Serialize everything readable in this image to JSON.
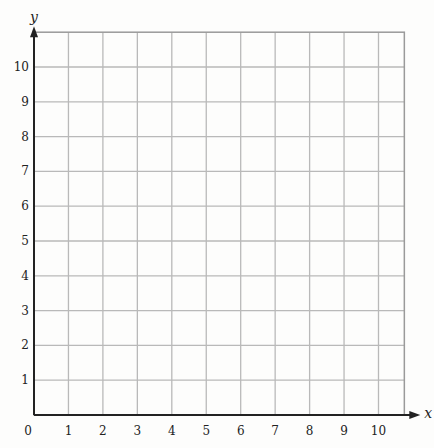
{
  "chart_data": {
    "type": "line",
    "title": "",
    "xlabel": "x",
    "ylabel": "y",
    "xlim": [
      0,
      10.75
    ],
    "ylim": [
      0,
      11
    ],
    "grid": true,
    "x_ticks": [
      "0",
      "1",
      "2",
      "3",
      "4",
      "5",
      "6",
      "7",
      "8",
      "9",
      "10"
    ],
    "y_ticks": [
      "1",
      "2",
      "3",
      "4",
      "5",
      "6",
      "7",
      "8",
      "9",
      "10"
    ],
    "series": [],
    "legend": null
  },
  "colors": {
    "grid": "#b9b9b9",
    "axis": "#222222",
    "border": "#9a9a9a",
    "background": "#fdfdfc"
  }
}
